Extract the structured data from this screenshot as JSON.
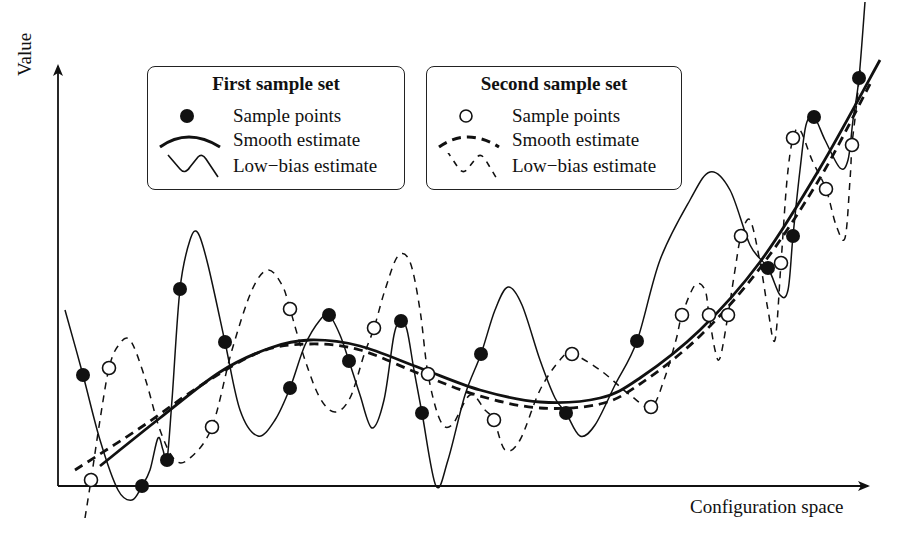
{
  "axes": {
    "y_label": "Value",
    "x_label": "Configuration space"
  },
  "legends": [
    {
      "title": "First sample set",
      "items": [
        {
          "symbol": "filled-circle",
          "label": "Sample points"
        },
        {
          "symbol": "thick-solid-curve",
          "label": "Smooth estimate"
        },
        {
          "symbol": "thin-solid-wiggle",
          "label": "Low−bias estimate"
        }
      ]
    },
    {
      "title": "Second sample set",
      "items": [
        {
          "symbol": "open-circle",
          "label": "Sample points"
        },
        {
          "symbol": "thick-dashed-curve",
          "label": "Smooth estimate"
        },
        {
          "symbol": "thin-dashed-wiggle",
          "label": "Low−bias estimate"
        }
      ]
    }
  ],
  "chart_data": {
    "type": "scatter",
    "title": "",
    "xlabel": "Configuration space",
    "ylabel": "Value",
    "grid": false,
    "legend_position": "top",
    "note": "Pixel coordinates (x right, y down) within the 911x534 figure; axes origin at (58,486).",
    "series": [
      {
        "name": "First sample set - Sample points",
        "marker": "filled-circle",
        "points": [
          [
            83,
            375
          ],
          [
            142,
            486
          ],
          [
            167,
            460
          ],
          [
            180,
            289
          ],
          [
            225,
            342
          ],
          [
            290,
            388
          ],
          [
            329,
            315
          ],
          [
            349,
            361
          ],
          [
            401,
            321
          ],
          [
            422,
            413
          ],
          [
            481,
            354
          ],
          [
            566,
            413
          ],
          [
            637,
            341
          ],
          [
            768,
            268
          ],
          [
            793,
            236
          ],
          [
            814,
            117
          ],
          [
            859,
            78
          ]
        ]
      },
      {
        "name": "Second sample set - Sample points",
        "marker": "open-circle",
        "points": [
          [
            91,
            480
          ],
          [
            109,
            368
          ],
          [
            212,
            427
          ],
          [
            290,
            309
          ],
          [
            374,
            328
          ],
          [
            428,
            374
          ],
          [
            494,
            420
          ],
          [
            572,
            354
          ],
          [
            651,
            407
          ],
          [
            682,
            315
          ],
          [
            709,
            315
          ],
          [
            728,
            315
          ],
          [
            741,
            236
          ],
          [
            781,
            263
          ],
          [
            793,
            138
          ],
          [
            826,
            189
          ],
          [
            852,
            145
          ]
        ]
      },
      {
        "name": "First sample set - Smooth estimate",
        "style": "thick-solid",
        "points": [
          [
            100,
            466
          ],
          [
            160,
            418
          ],
          [
            220,
            372
          ],
          [
            270,
            348
          ],
          [
            310,
            340
          ],
          [
            360,
            346
          ],
          [
            420,
            368
          ],
          [
            480,
            390
          ],
          [
            540,
            402
          ],
          [
            600,
            398
          ],
          [
            640,
            378
          ],
          [
            700,
            330
          ],
          [
            760,
            262
          ],
          [
            820,
            168
          ],
          [
            880,
            60
          ]
        ]
      },
      {
        "name": "Second sample set - Smooth estimate",
        "style": "thick-dashed",
        "points": [
          [
            75,
            470
          ],
          [
            140,
            428
          ],
          [
            200,
            386
          ],
          [
            260,
            352
          ],
          [
            310,
            344
          ],
          [
            360,
            350
          ],
          [
            420,
            374
          ],
          [
            480,
            396
          ],
          [
            540,
            408
          ],
          [
            600,
            404
          ],
          [
            640,
            384
          ],
          [
            700,
            336
          ],
          [
            760,
            268
          ],
          [
            820,
            178
          ],
          [
            870,
            84
          ]
        ]
      },
      {
        "name": "First sample set - Low-bias estimate",
        "style": "thin-solid",
        "points": [
          [
            65,
            310
          ],
          [
            83,
            375
          ],
          [
            100,
            440
          ],
          [
            118,
            490
          ],
          [
            132,
            500
          ],
          [
            142,
            486
          ],
          [
            150,
            470
          ],
          [
            158,
            438
          ],
          [
            163,
            450
          ],
          [
            167,
            460
          ],
          [
            172,
            400
          ],
          [
            180,
            289
          ],
          [
            190,
            240
          ],
          [
            198,
            233
          ],
          [
            208,
            265
          ],
          [
            225,
            342
          ],
          [
            240,
            410
          ],
          [
            258,
            436
          ],
          [
            275,
            420
          ],
          [
            290,
            388
          ],
          [
            305,
            345
          ],
          [
            320,
            320
          ],
          [
            329,
            315
          ],
          [
            340,
            335
          ],
          [
            349,
            361
          ],
          [
            360,
            395
          ],
          [
            372,
            428
          ],
          [
            384,
            400
          ],
          [
            394,
            335
          ],
          [
            401,
            321
          ],
          [
            407,
            330
          ],
          [
            414,
            370
          ],
          [
            422,
            413
          ],
          [
            436,
            486
          ],
          [
            448,
            460
          ],
          [
            465,
            395
          ],
          [
            481,
            354
          ],
          [
            495,
            310
          ],
          [
            508,
            287
          ],
          [
            522,
            305
          ],
          [
            540,
            360
          ],
          [
            555,
            398
          ],
          [
            566,
            413
          ],
          [
            580,
            436
          ],
          [
            595,
            425
          ],
          [
            615,
            385
          ],
          [
            637,
            341
          ],
          [
            660,
            260
          ],
          [
            690,
            200
          ],
          [
            710,
            172
          ],
          [
            730,
            190
          ],
          [
            750,
            245
          ],
          [
            768,
            268
          ],
          [
            780,
            295
          ],
          [
            788,
            290
          ],
          [
            793,
            236
          ],
          [
            800,
            170
          ],
          [
            806,
            125
          ],
          [
            814,
            117
          ],
          [
            825,
            140
          ],
          [
            840,
            168
          ],
          [
            848,
            160
          ],
          [
            853,
            120
          ],
          [
            859,
            78
          ],
          [
            865,
            2
          ]
        ]
      },
      {
        "name": "Second sample set - Low-bias estimate",
        "style": "thin-dashed",
        "points": [
          [
            85,
            518
          ],
          [
            91,
            480
          ],
          [
            100,
            420
          ],
          [
            109,
            368
          ],
          [
            118,
            346
          ],
          [
            130,
            340
          ],
          [
            145,
            378
          ],
          [
            160,
            430
          ],
          [
            175,
            460
          ],
          [
            190,
            458
          ],
          [
            212,
            427
          ],
          [
            232,
            350
          ],
          [
            252,
            290
          ],
          [
            268,
            270
          ],
          [
            282,
            285
          ],
          [
            290,
            309
          ],
          [
            305,
            360
          ],
          [
            320,
            398
          ],
          [
            335,
            412
          ],
          [
            350,
            398
          ],
          [
            364,
            355
          ],
          [
            374,
            328
          ],
          [
            385,
            290
          ],
          [
            398,
            256
          ],
          [
            410,
            262
          ],
          [
            420,
            310
          ],
          [
            428,
            374
          ],
          [
            440,
            420
          ],
          [
            452,
            425
          ],
          [
            470,
            395
          ],
          [
            485,
            410
          ],
          [
            494,
            420
          ],
          [
            505,
            450
          ],
          [
            520,
            440
          ],
          [
            540,
            390
          ],
          [
            560,
            360
          ],
          [
            572,
            354
          ],
          [
            600,
            370
          ],
          [
            630,
            395
          ],
          [
            651,
            407
          ],
          [
            664,
            380
          ],
          [
            676,
            340
          ],
          [
            682,
            315
          ],
          [
            695,
            285
          ],
          [
            705,
            290
          ],
          [
            709,
            315
          ],
          [
            715,
            350
          ],
          [
            720,
            358
          ],
          [
            728,
            315
          ],
          [
            735,
            270
          ],
          [
            741,
            236
          ],
          [
            750,
            220
          ],
          [
            760,
            262
          ],
          [
            768,
            310
          ],
          [
            775,
            340
          ],
          [
            781,
            263
          ],
          [
            787,
            180
          ],
          [
            793,
            138
          ],
          [
            800,
            130
          ],
          [
            812,
            160
          ],
          [
            826,
            189
          ],
          [
            836,
            225
          ],
          [
            845,
            238
          ],
          [
            850,
            180
          ],
          [
            852,
            145
          ],
          [
            856,
            110
          ],
          [
            860,
            70
          ]
        ]
      }
    ]
  }
}
